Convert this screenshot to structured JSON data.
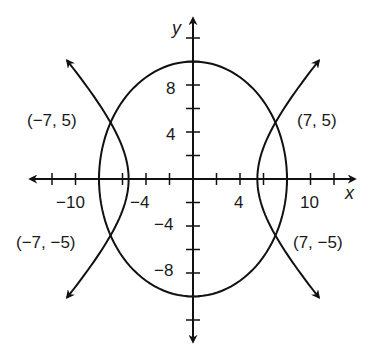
{
  "chart_data": {
    "type": "line",
    "title": "",
    "xlabel": "x",
    "ylabel": "y",
    "xlim": [
      -13.8,
      13.8
    ],
    "ylim": [
      -13.8,
      13.8
    ],
    "grid": false,
    "x_tick_step": 2,
    "y_tick_step": 2,
    "x_tick_labels": [
      {
        "value": -10,
        "label": "−10"
      },
      {
        "value": -4,
        "label": "−4"
      },
      {
        "value": 4,
        "label": "4"
      },
      {
        "value": 10,
        "label": "10"
      }
    ],
    "y_tick_labels": [
      {
        "value": 8,
        "label": "8"
      },
      {
        "value": 4,
        "label": "4"
      },
      {
        "value": -4,
        "label": "−4"
      },
      {
        "value": -8,
        "label": "−8"
      }
    ],
    "series": [
      {
        "name": "ellipse",
        "kind": "ellipse",
        "equation": "x^2/64 + y^2/100 = 1",
        "a": 8,
        "b": 10
      },
      {
        "name": "hyperbola",
        "kind": "hyperbola",
        "equation": "x^2/a^2 - y^2/b^2 = 1",
        "a2": 30,
        "b2": 36,
        "y_extent": 10.1,
        "arrows": true
      }
    ],
    "annotations": [
      {
        "label": "(−7, 5)",
        "x": -7,
        "y": 5
      },
      {
        "label": "(7, 5)",
        "x": 7,
        "y": 5
      },
      {
        "label": "(−7, −5)",
        "x": -7,
        "y": -5
      },
      {
        "label": "(7, −5)",
        "x": 7,
        "y": -5
      }
    ]
  },
  "labels": {
    "x_axis": "x",
    "y_axis": "y",
    "points": [
      "(−7, 5)",
      "(7, 5)",
      "(−7, −5)",
      "(7, −5)"
    ],
    "x_ticks": [
      "−10",
      "−4",
      "4",
      "10"
    ],
    "y_ticks": [
      "8",
      "4",
      "−4",
      "−8"
    ]
  }
}
